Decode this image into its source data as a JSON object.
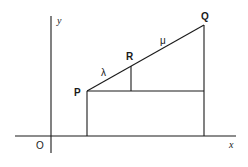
{
  "diagram": {
    "title": "",
    "axes": {
      "x_label": "x",
      "y_label": "y",
      "origin_label": "O"
    },
    "points": {
      "P": "P",
      "Q": "Q",
      "R": "R"
    },
    "segment_labels": {
      "PR": "λ",
      "RQ": "μ"
    },
    "colors": {
      "line": "#1a1a1a",
      "background": "#ffffff"
    }
  }
}
